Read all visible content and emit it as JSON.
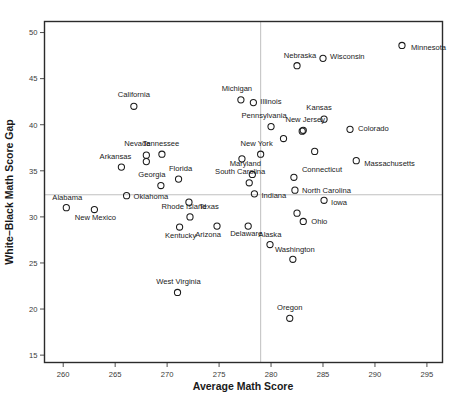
{
  "chart_data": {
    "type": "scatter",
    "title": "",
    "xlabel": "Average Math Score",
    "ylabel": "White–Black Math Score Gap",
    "xlim": [
      258.2,
      296.5
    ],
    "ylim": [
      14.2,
      51.2
    ],
    "xticks": [
      260,
      265,
      270,
      275,
      280,
      285,
      290,
      295
    ],
    "yticks": [
      15,
      20,
      25,
      30,
      35,
      40,
      45,
      50
    ],
    "grid": false,
    "legend": "none",
    "reference_lines": {
      "vertical_x": 279.0,
      "horizontal_y": 32.4
    },
    "marker_style": "open-circle",
    "points": [
      {
        "label": "Minnesota",
        "x": 292.6,
        "y": 48.6,
        "lx": 9,
        "ly": 4.5,
        "anchor": "start"
      },
      {
        "label": "Wisconsin",
        "x": 285.0,
        "y": 47.2,
        "lx": 7,
        "ly": 1.0,
        "anchor": "start"
      },
      {
        "label": "Nebraska",
        "x": 282.5,
        "y": 46.4,
        "lx": 3,
        "ly": -7.5,
        "anchor": "middle"
      },
      {
        "label": "Illinois",
        "x": 278.3,
        "y": 42.4,
        "lx": 7,
        "ly": 1.0,
        "anchor": "start"
      },
      {
        "label": "Michigan",
        "x": 277.1,
        "y": 42.7,
        "lx": -4,
        "ly": -9.0,
        "anchor": "middle"
      },
      {
        "label": "California",
        "x": 266.8,
        "y": 42.0,
        "lx": 0,
        "ly": -9.0,
        "anchor": "middle"
      },
      {
        "label": "Kansas",
        "x": 285.1,
        "y": 40.6,
        "lx": -5,
        "ly": -9.0,
        "anchor": "middle"
      },
      {
        "label": "Colorado",
        "x": 287.6,
        "y": 39.5,
        "lx": 8,
        "ly": 1.5,
        "anchor": "start"
      },
      {
        "label": "Pennsylvania",
        "x": 280.0,
        "y": 39.8,
        "lx": -7,
        "ly": -8.5,
        "anchor": "middle"
      },
      {
        "label": "New Jersey",
        "x": 283.1,
        "y": 39.4,
        "lx": 2,
        "ly": -8.5,
        "anchor": "middle"
      },
      {
        "label": "Kansas-pt2",
        "x": 283.0,
        "y": 39.3,
        "lx": 0,
        "ly": 0,
        "anchor": "middle",
        "hide_label": true
      },
      {
        "label": "NJ-pt2",
        "x": 281.2,
        "y": 38.5,
        "lx": 0,
        "ly": 0,
        "anchor": "middle",
        "hide_label": true
      },
      {
        "label": "New York",
        "x": 279.0,
        "y": 36.8,
        "lx": -4,
        "ly": -8.5,
        "anchor": "middle"
      },
      {
        "label": "Tennessee",
        "x": 269.5,
        "y": 36.8,
        "lx": -1,
        "ly": -8.5,
        "anchor": "middle"
      },
      {
        "label": "Nevada",
        "x": 268.0,
        "y": 36.7,
        "lx": -9,
        "ly": -9.0,
        "anchor": "middle"
      },
      {
        "label": "Nevada-pt2",
        "x": 268.0,
        "y": 36.0,
        "lx": 0,
        "ly": 0,
        "anchor": "middle",
        "hide_label": true
      },
      {
        "label": "Massachusetts",
        "x": 288.2,
        "y": 36.1,
        "lx": 8,
        "ly": 5.0,
        "anchor": "start"
      },
      {
        "label": "Arkansas",
        "x": 265.6,
        "y": 35.4,
        "lx": -6,
        "ly": -8.5,
        "anchor": "middle"
      },
      {
        "label": "NY-pt2",
        "x": 277.2,
        "y": 36.3,
        "lx": 0,
        "ly": 0,
        "anchor": "middle",
        "hide_label": true
      },
      {
        "label": "NJ-pt3",
        "x": 284.2,
        "y": 37.1,
        "lx": 0,
        "ly": 0,
        "anchor": "middle",
        "hide_label": true
      },
      {
        "label": "Maryland",
        "x": 278.2,
        "y": 34.6,
        "lx": -7,
        "ly": -8.5,
        "anchor": "middle"
      },
      {
        "label": "Florida",
        "x": 271.1,
        "y": 34.1,
        "lx": 2,
        "ly": -8.5,
        "anchor": "middle"
      },
      {
        "label": "Connecticut",
        "x": 282.2,
        "y": 34.3,
        "lx": 8,
        "ly": -5.5,
        "anchor": "start"
      },
      {
        "label": "South Carolina",
        "x": 277.9,
        "y": 33.7,
        "lx": -9,
        "ly": -8.5,
        "anchor": "middle"
      },
      {
        "label": "Georgia",
        "x": 269.4,
        "y": 33.4,
        "lx": -9,
        "ly": -8.5,
        "anchor": "middle"
      },
      {
        "label": "North Carolina",
        "x": 282.3,
        "y": 32.9,
        "lx": 7,
        "ly": 3.0,
        "anchor": "start"
      },
      {
        "label": "Indiana",
        "x": 278.4,
        "y": 32.5,
        "lx": 7,
        "ly": 4.5,
        "anchor": "start"
      },
      {
        "label": "Oklahoma",
        "x": 266.1,
        "y": 32.3,
        "lx": 7,
        "ly": 3.0,
        "anchor": "start"
      },
      {
        "label": "Alabama",
        "x": 260.3,
        "y": 31.0,
        "lx": 1,
        "ly": -7.5,
        "anchor": "middle"
      },
      {
        "label": "Iowa",
        "x": 285.1,
        "y": 31.8,
        "lx": 7,
        "ly": 4.5,
        "anchor": "start"
      },
      {
        "label": "Texas",
        "x": 272.1,
        "y": 31.6,
        "lx": 10,
        "ly": 6.5,
        "anchor": "start"
      },
      {
        "label": "New Mexico",
        "x": 263.0,
        "y": 30.8,
        "lx": 1,
        "ly": 10.0,
        "anchor": "middle"
      },
      {
        "label": "Ohio",
        "x": 283.1,
        "y": 29.5,
        "lx": 8,
        "ly": 3.0,
        "anchor": "start"
      },
      {
        "label": "Ohio-pt2",
        "x": 282.5,
        "y": 30.4,
        "lx": 0,
        "ly": 0,
        "anchor": "middle",
        "hide_label": true
      },
      {
        "label": "Rhode Island",
        "x": 272.2,
        "y": 30.0,
        "lx": -6,
        "ly": -8.0,
        "anchor": "middle"
      },
      {
        "label": "Kentucky",
        "x": 271.2,
        "y": 28.9,
        "lx": 1,
        "ly": 11.0,
        "anchor": "middle"
      },
      {
        "label": "Delaware",
        "x": 277.8,
        "y": 29.0,
        "lx": -2,
        "ly": 9.5,
        "anchor": "middle"
      },
      {
        "label": "Arizona",
        "x": 274.8,
        "y": 29.0,
        "lx": -9,
        "ly": 10.5,
        "anchor": "middle"
      },
      {
        "label": "Alaska",
        "x": 279.9,
        "y": 27.0,
        "lx": 0,
        "ly": -7.5,
        "anchor": "middle"
      },
      {
        "label": "Washington",
        "x": 282.1,
        "y": 25.4,
        "lx": 2,
        "ly": -7.5,
        "anchor": "middle"
      },
      {
        "label": "West Virginia",
        "x": 271.0,
        "y": 21.8,
        "lx": 1,
        "ly": -8.0,
        "anchor": "middle"
      },
      {
        "label": "Oregon",
        "x": 281.8,
        "y": 19.0,
        "lx": 0,
        "ly": -8.0,
        "anchor": "middle"
      }
    ]
  },
  "colors": {
    "marker_stroke": "#1a1a1a",
    "frame": "#2b2b2b",
    "refline": "#b9b9b9",
    "background": "#ffffff",
    "text": "#1a1a1a"
  }
}
